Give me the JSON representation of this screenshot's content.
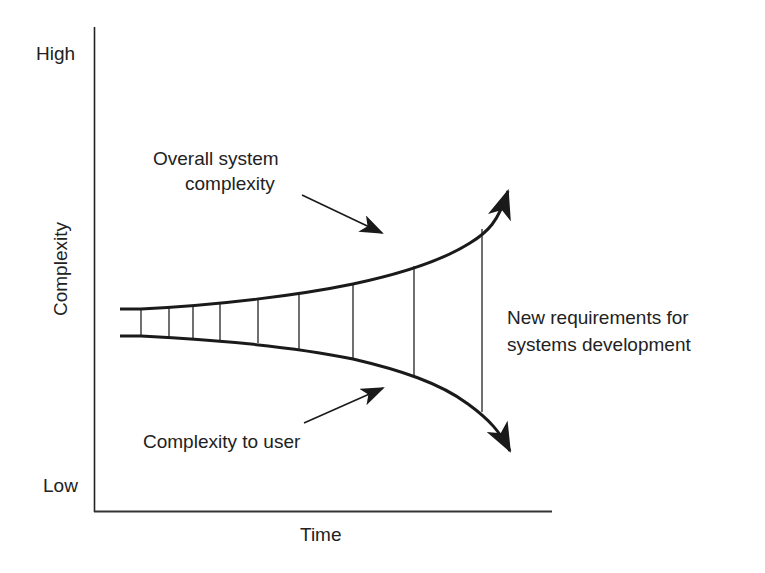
{
  "diagram": {
    "title": "",
    "y_axis": {
      "label": "Complexity",
      "high_label": "High",
      "low_label": "Low"
    },
    "x_axis": {
      "label": "Time"
    },
    "annotations": {
      "upper_curve_line1": "Overall system",
      "upper_curve_line2": "complexity",
      "lower_curve": "Complexity to user",
      "gap_line1": "New requirements for",
      "gap_line2": "systems development"
    },
    "colors": {
      "ink": "#1a1a1a",
      "background": "#ffffff"
    },
    "vertical_separators_x": [
      141,
      169,
      193,
      220,
      258,
      299,
      353,
      414,
      482
    ]
  }
}
